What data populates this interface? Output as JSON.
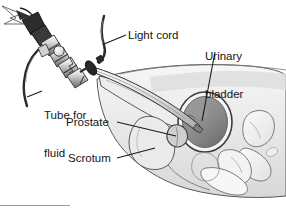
{
  "figure": {
    "type": "medical-line-illustration",
    "background_color": "#ffffff",
    "ink_color": "#151515",
    "tissue_fill": "#e9e9e9",
    "bladder_fill": "#8d8d8d",
    "bone_fill": "#efefef",
    "shadow_gray": "#c9c9c9",
    "labels": [
      {
        "id": "light-cord",
        "text": "Light cord",
        "lines": [
          "Light cord"
        ]
      },
      {
        "id": "urinary-bladder",
        "text": "Urinary bladder",
        "lines": [
          "Urinary",
          "bladder"
        ]
      },
      {
        "id": "tube-for-fluid",
        "text": "Tube for fluid",
        "lines": [
          "Tube for",
          "fluid"
        ]
      },
      {
        "id": "prostate",
        "text": "Prostate",
        "lines": [
          "Prostate"
        ]
      },
      {
        "id": "scrotum",
        "text": "Scrotum",
        "lines": [
          "Scrotum"
        ]
      }
    ],
    "label_text": {
      "light_cord": "Light cord",
      "urinary_line1": "Urinary",
      "urinary_line2": "bladder",
      "tube_line1": "Tube for",
      "tube_line2": "fluid",
      "prostate": "Prostate",
      "scrotum": "Scrotum"
    },
    "footer_rule": {
      "visible": true,
      "color": "#9a9a9a"
    }
  }
}
